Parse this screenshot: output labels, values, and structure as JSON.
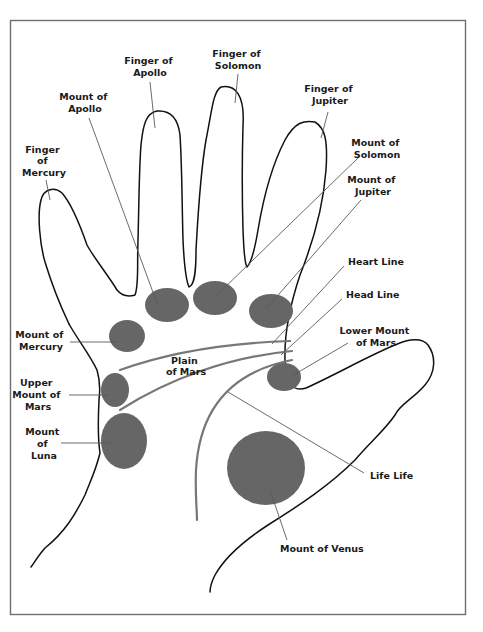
{
  "diagram": {
    "title": "",
    "colors": {
      "background": "#ffffff",
      "frame": "#6e6e6e",
      "outline": "#111111",
      "mount_fill": "#666666",
      "leader": "#5a5a5a",
      "palm_line": "#777777",
      "label_text": "#1a1a1a"
    },
    "labels": {
      "finger_of_apollo": [
        "Finger of",
        "Apollo"
      ],
      "finger_of_solomon": [
        "Finger of",
        "Solomon"
      ],
      "finger_of_jupiter": [
        "Finger of",
        "Jupiter"
      ],
      "finger_of_mercury": [
        "Finger",
        "of",
        "Mercury"
      ],
      "mount_of_apollo": [
        "Mount of",
        "Apollo"
      ],
      "mount_of_solomon": [
        "Mount of",
        "Solomon"
      ],
      "mount_of_jupiter": [
        "Mount of",
        "Jupiter"
      ],
      "heart_line": [
        "Heart Line"
      ],
      "head_line": [
        "Head Line"
      ],
      "lower_mount_of_mars": [
        "Lower Mount",
        "of Mars"
      ],
      "mount_of_mercury": [
        "Mount of",
        "Mercury"
      ],
      "plain_of_mars": [
        "Plain",
        "of Mars"
      ],
      "upper_mount_of_mars": [
        "Upper",
        "Mount of",
        "Mars"
      ],
      "mount_of_luna": [
        "Mount",
        "of",
        "Luna"
      ],
      "life_line": [
        "Life Life"
      ],
      "mount_of_venus": [
        "Mount of Venus"
      ]
    },
    "mounts": [
      {
        "name": "Mount of Apollo",
        "cx": 167,
        "cy": 305,
        "rx": 22,
        "ry": 17
      },
      {
        "name": "Mount of Solomon",
        "cx": 215,
        "cy": 298,
        "rx": 22,
        "ry": 17
      },
      {
        "name": "Mount of Jupiter",
        "cx": 271,
        "cy": 311,
        "rx": 22,
        "ry": 17
      },
      {
        "name": "Mount of Mercury",
        "cx": 127,
        "cy": 336,
        "rx": 18,
        "ry": 16
      },
      {
        "name": "Upper Mount of Mars",
        "cx": 115,
        "cy": 390,
        "rx": 14,
        "ry": 17
      },
      {
        "name": "Lower Mount of Mars",
        "cx": 284,
        "cy": 377,
        "rx": 17,
        "ry": 14
      },
      {
        "name": "Mount of Luna",
        "cx": 124,
        "cy": 441,
        "rx": 23,
        "ry": 28
      },
      {
        "name": "Mount of Venus",
        "cx": 266,
        "cy": 468,
        "rx": 39,
        "ry": 37
      }
    ]
  }
}
